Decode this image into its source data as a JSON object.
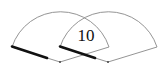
{
  "diagram": {
    "type": "overlapping-sectors",
    "overlap_label": "10",
    "sectors": [
      {
        "name": "sector-left",
        "center": [
          60,
          62
        ],
        "radius": 51,
        "start_angle_deg": 163,
        "end_angle_deg": 17
      },
      {
        "name": "sector-right",
        "center": [
          108,
          62
        ],
        "radius": 51,
        "start_angle_deg": 163,
        "end_angle_deg": 17
      }
    ],
    "colors": {
      "outline": "#888888",
      "thick_edge": "#111111",
      "text": "#111111"
    }
  }
}
